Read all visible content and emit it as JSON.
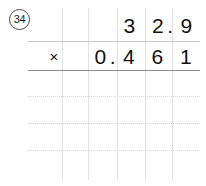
{
  "problem": {
    "number_label": "34",
    "operator_symbol": "×",
    "multiplicand": {
      "text": "32.9",
      "cells": [
        {
          "digit": "3",
          "decimal_after": false
        },
        {
          "digit": "2",
          "decimal_after": true
        },
        {
          "digit": "9",
          "decimal_after": false
        }
      ]
    },
    "multiplier": {
      "text": "0.461",
      "cells": [
        {
          "digit": "0",
          "decimal_after": true
        },
        {
          "digit": "4",
          "decimal_after": false
        },
        {
          "digit": "6",
          "decimal_after": false
        },
        {
          "digit": "1",
          "decimal_after": false
        }
      ]
    },
    "answer_rows": [
      "",
      "",
      "",
      ""
    ]
  },
  "colors": {
    "ink": "#111111",
    "grid_line": "#e2e2e4",
    "dotted_line": "#d8d8da",
    "upper_rule": "#c9c9cb",
    "lower_rule": "#8a8a8e",
    "circle_border": "#4a4a4a",
    "page_background": "#ffffff"
  },
  "grid": {
    "vertical_line_x": [
      62,
      88,
      117,
      145,
      172
    ],
    "horizontal_dotted_y": [
      70,
      96,
      123,
      150
    ],
    "vertical_line_top": 8,
    "vertical_line_bottom": 180,
    "horizontal_left": 28,
    "horizontal_right": 200
  }
}
